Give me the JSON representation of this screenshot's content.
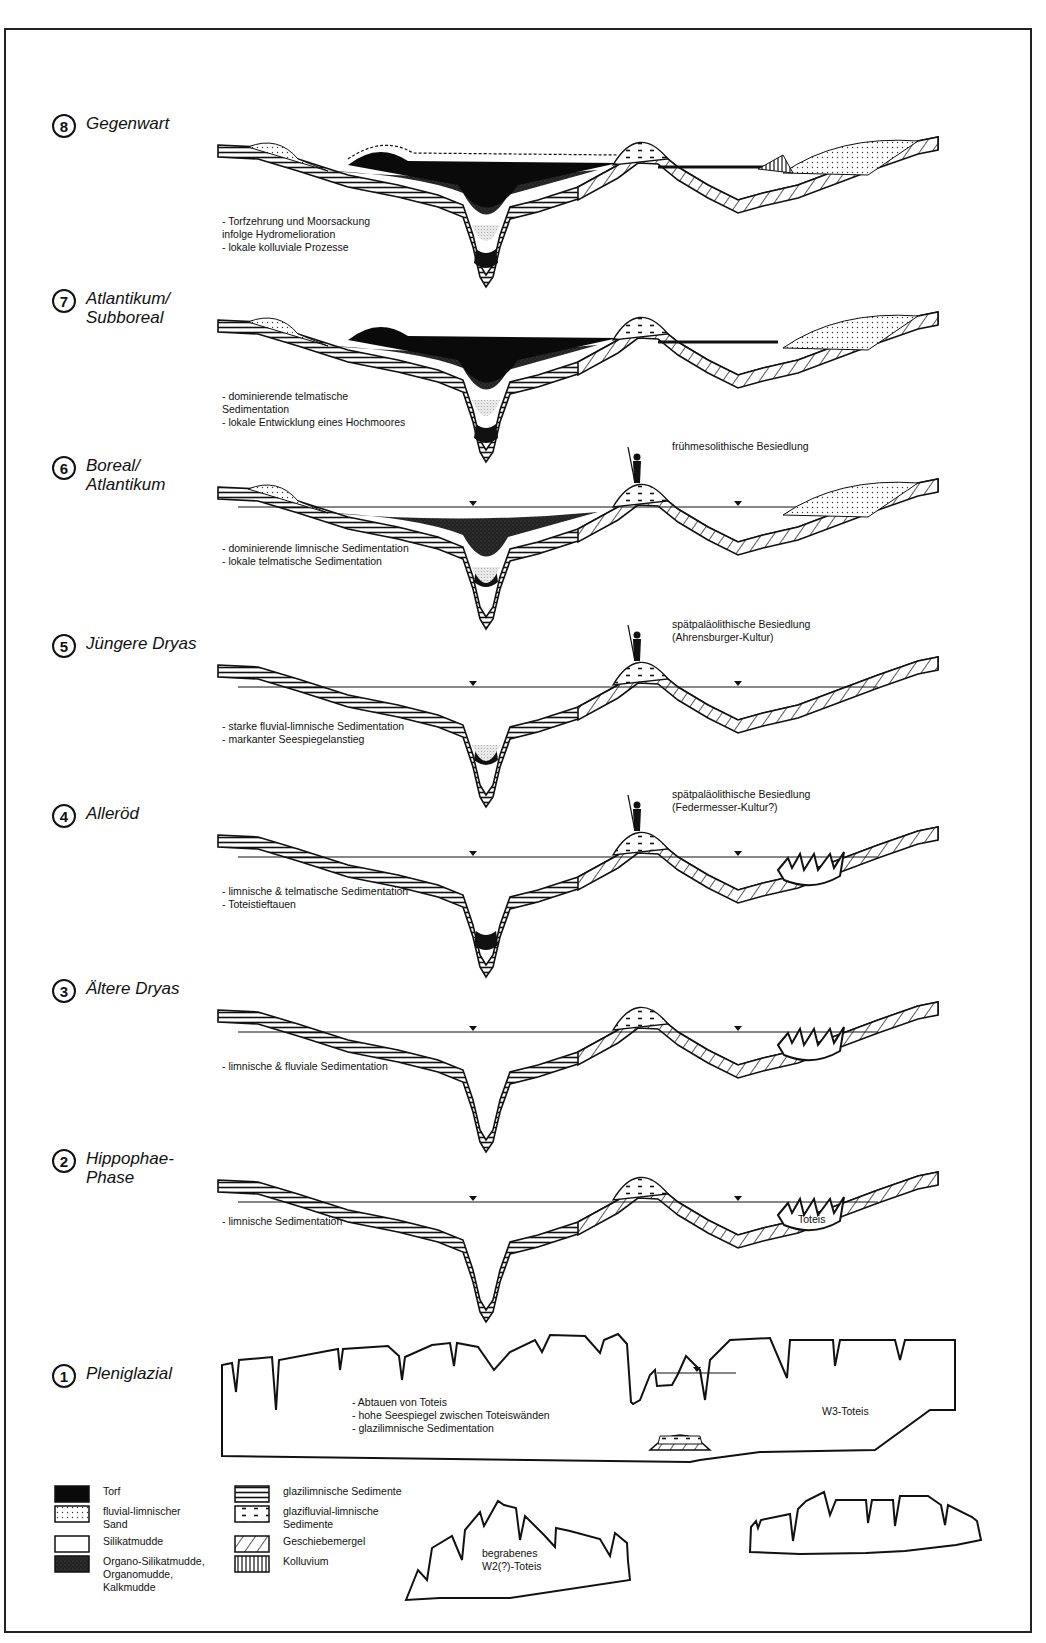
{
  "figure": {
    "frame": "bordered",
    "stages": [
      {
        "id": 8,
        "name": "Gegenwart",
        "top": 120,
        "notes": "- Torfzehrung und Moorsackung\n infolge Hydromelioration\n- lokale kolluviale Prozesse",
        "settlement": null
      },
      {
        "id": 7,
        "name": "Atlantikum/\nSubboreal",
        "top": 295,
        "notes": "- dominierende telmatische\n Sedimentation\n- lokale Entwicklung eines Hochmoores",
        "settlement": null
      },
      {
        "id": 6,
        "name": "Boreal/\nAtlantikum",
        "top": 462,
        "notes": "- dominierende limnische Sedimentation\n- lokale telmatische Sedimentation",
        "settlement": "frühmesolithische Besiedlung"
      },
      {
        "id": 5,
        "name": "Jüngere Dryas",
        "top": 640,
        "notes": "- starke fluvial-limnische Sedimentation\n- markanter Seespiegelanstieg",
        "settlement": "spätpaläolithische Besiedlung\n   (Ahrensburger-Kultur)"
      },
      {
        "id": 4,
        "name": "Alleröd",
        "top": 810,
        "notes": "- limnische & telmatische Sedimentation\n- Toteistieftauen",
        "settlement": "spätpaläolithische Besiedlung\n   (Federmesser-Kultur?)"
      },
      {
        "id": 3,
        "name": "Ältere Dryas",
        "top": 985,
        "notes": "- limnische & fluviale Sedimentation",
        "settlement": null
      },
      {
        "id": 2,
        "name": "Hippophae-\nPhase",
        "top": 1155,
        "notes": "- limnische Sedimentation",
        "settlement": null,
        "ice_label": "Toteis"
      },
      {
        "id": 1,
        "name": "Pleniglazial",
        "top": 1370,
        "notes": "- Abtauen von Toteis\n- hohe Seespiegel zwischen Toteiswänden\n- glazilimnische Sedimentation",
        "settlement": null,
        "ice_label": "W3-Toteis"
      }
    ],
    "buried_ice_label": "begrabenes\nW2(?)-Toteis",
    "legend": {
      "left": [
        {
          "label": "Torf",
          "pattern": "torf"
        },
        {
          "label": "fluvial-limnischer\nSand",
          "pattern": "sand"
        },
        {
          "label": "Silikatmudde",
          "pattern": "blank"
        },
        {
          "label": "Organo-Silikatmudde,\nOrganomudde,\nKalkmudde",
          "pattern": "organo"
        }
      ],
      "right": [
        {
          "label": "glazilimnische Sedimente",
          "pattern": "glazil"
        },
        {
          "label": "glazifluvial-limnische\nSedimente",
          "pattern": "glazifl"
        },
        {
          "label": "Geschiebemergel",
          "pattern": "diag"
        },
        {
          "label": "Kolluvium",
          "pattern": "vert"
        }
      ]
    },
    "colors": {
      "ink": "#111111",
      "paper": "#ffffff",
      "organo": "#2a2a2a",
      "gray_mud": "#c8c8c8"
    }
  }
}
